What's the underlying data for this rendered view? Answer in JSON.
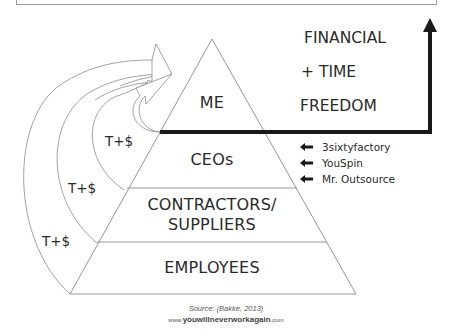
{
  "pyramid": {
    "tiers": [
      {
        "label": "ME"
      },
      {
        "label": "CEOs"
      },
      {
        "label_line1": "CONTRACTORS/",
        "label_line2": "SUPPLIERS"
      },
      {
        "label": "EMPLOYEES"
      }
    ]
  },
  "flows": {
    "labels": [
      "T+$",
      "T+$",
      "T+$"
    ]
  },
  "goal": {
    "line1": "FINANCIAL",
    "line2": "+ TIME",
    "line3": "FREEDOM"
  },
  "companies": [
    {
      "name": "3sixtyfactory",
      "icon": "left-arrow-icon"
    },
    {
      "name": "YouSpin",
      "icon": "left-arrow-icon"
    },
    {
      "name": "Mr. Outsource",
      "icon": "left-arrow-icon"
    }
  ],
  "footer": {
    "source": "Source: (Bakke, 2013)",
    "url_prefix": "www.",
    "url_domain": "youwillneverworkagain",
    "url_suffix": ".com"
  },
  "colors": {
    "line": "#8a8a8a",
    "bold_line": "#1a1a1a",
    "text": "#2a2a2a"
  }
}
